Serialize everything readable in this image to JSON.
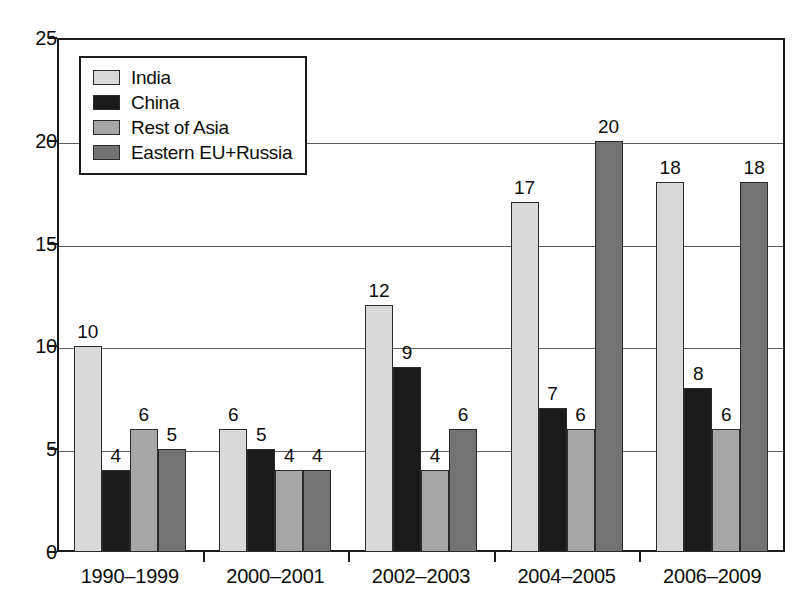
{
  "chart_data": {
    "type": "bar",
    "title": "",
    "subtitle": "",
    "xlabel": "",
    "ylabel": "",
    "categories": [
      "1990–1999",
      "2000–2001",
      "2002–2003",
      "2004–2005",
      "2006–2009"
    ],
    "series": [
      {
        "name": "India",
        "color": "#d9d9d9",
        "values": [
          10,
          6,
          12,
          17,
          18
        ]
      },
      {
        "name": "China",
        "color": "#1a1a1a",
        "values": [
          4,
          5,
          9,
          7,
          8
        ]
      },
      {
        "name": "Rest of Asia",
        "color": "#a6a6a6",
        "values": [
          6,
          4,
          4,
          6,
          6
        ]
      },
      {
        "name": "Eastern EU+Russia",
        "color": "#737373",
        "values": [
          5,
          4,
          6,
          20,
          18
        ]
      }
    ],
    "ylim": [
      0,
      25
    ],
    "ytick_values": [
      0,
      5,
      10,
      15,
      20,
      25
    ],
    "ytick_labels": [
      "0",
      "5",
      "10",
      "15",
      "20",
      "25"
    ],
    "grid": true,
    "grid_axis": "y",
    "legend_position": "upper-left",
    "data_labels": true,
    "data_label_values": [
      [
        "10",
        "4",
        "6",
        "5"
      ],
      [
        "6",
        "5",
        "4",
        "4"
      ],
      [
        "12",
        "9",
        "4",
        "6"
      ],
      [
        "17",
        "7",
        "6",
        "20"
      ],
      [
        "18",
        "8",
        "6",
        "18"
      ]
    ]
  },
  "legend": {
    "items": [
      {
        "label": "India",
        "swatch": "legend-swatch-india"
      },
      {
        "label": "China",
        "swatch": "legend-swatch-china"
      },
      {
        "label": "Rest of Asia",
        "swatch": "legend-swatch-rest-of-asia"
      },
      {
        "label": "Eastern EU+Russia",
        "swatch": "legend-swatch-eastern-eu-russia"
      }
    ]
  },
  "axes": {
    "frame_color": "#1b1b1b",
    "gridline_color": "#5d5d5d",
    "text_color": "#0d0d0d"
  }
}
